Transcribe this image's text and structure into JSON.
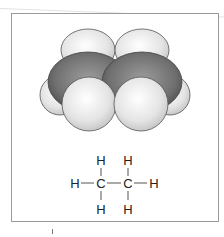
{
  "figure": {
    "model": {
      "type": "space-filling",
      "atoms": {
        "carbon": 2,
        "hydrogen": 6
      }
    },
    "colors": {
      "carbon": "#7a7a7a",
      "hydrogen": "#e6e6e6",
      "outline": "#444444",
      "frame": "#9a9a9a"
    },
    "structural_formula": {
      "top": [
        "H",
        "H"
      ],
      "middle": [
        "H",
        "C",
        "C",
        "H"
      ],
      "bottom": [
        "H",
        "H"
      ],
      "bond": "—"
    }
  }
}
